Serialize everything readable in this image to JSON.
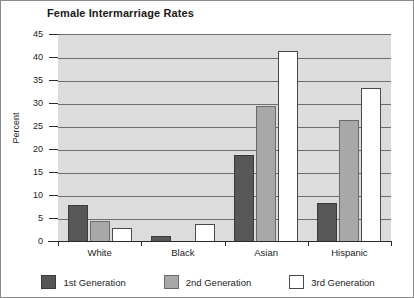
{
  "chart_data": {
    "type": "bar",
    "title": "Female Intermarriage Rates",
    "xlabel": "",
    "ylabel": "Percent",
    "ylim": [
      0,
      45
    ],
    "ytick_step": 5,
    "yticks": [
      0,
      5,
      10,
      15,
      20,
      25,
      30,
      35,
      40,
      45
    ],
    "grid": true,
    "legend_position": "bottom",
    "categories": [
      "White",
      "Black",
      "Asian",
      "Hispanic"
    ],
    "series": [
      {
        "name": "1st Generation",
        "color": "#575757",
        "values": [
          8,
          1.2,
          19,
          8.5
        ]
      },
      {
        "name": "2nd Generation",
        "color": "#a8a8a8",
        "values": [
          4.5,
          0,
          29.5,
          26.5
        ]
      },
      {
        "name": "3rd Generation",
        "color": "#ffffff",
        "values": [
          3,
          4,
          41.5,
          33.5
        ]
      }
    ]
  },
  "legend": {
    "items": [
      {
        "label": "1st Generation"
      },
      {
        "label": "2nd Generation"
      },
      {
        "label": "3rd Generation"
      }
    ]
  }
}
